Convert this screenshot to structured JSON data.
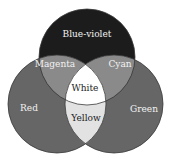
{
  "diagram": {
    "type": "venn",
    "title": "",
    "circles": [
      {
        "id": "blue-violet",
        "label": "Blue-violet",
        "cx": 87,
        "cy": 57,
        "r": 48,
        "fill": "#1c1c1c"
      },
      {
        "id": "red",
        "label": "Red",
        "cx": 57,
        "cy": 104,
        "r": 49,
        "fill": "#666666"
      },
      {
        "id": "green",
        "label": "Green",
        "cx": 114,
        "cy": 104,
        "r": 49,
        "fill": "#666666"
      }
    ],
    "regions": {
      "blue_violet": {
        "label": "Blue-violet",
        "x": 87,
        "y": 34
      },
      "magenta": {
        "label": "Magenta",
        "x": 55,
        "y": 64,
        "fill": "#8a8a8a"
      },
      "cyan": {
        "label": "Cyan",
        "x": 120,
        "y": 64,
        "fill": "#8a8a8a"
      },
      "white": {
        "label": "White",
        "x": 85,
        "y": 88,
        "fill": "#ffffff"
      },
      "red": {
        "label": "Red",
        "x": 29,
        "y": 108
      },
      "green": {
        "label": "Green",
        "x": 144,
        "y": 109
      },
      "yellow": {
        "label": "Yellow",
        "x": 86,
        "y": 118,
        "fill": "#e2e2e2"
      }
    }
  }
}
